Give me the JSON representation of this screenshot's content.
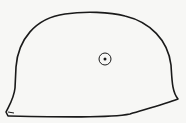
{
  "figure": {
    "stroke_color": "#1a1a1a",
    "background_color": "#f7f7f5",
    "features": [
      "helmet-outline",
      "ventilation-hole"
    ]
  }
}
